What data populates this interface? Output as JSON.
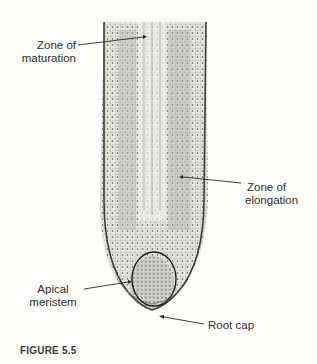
{
  "figure": {
    "caption": "FIGURE 5.5",
    "labels": {
      "maturation_line1": "Zone of",
      "maturation_line2": "maturation",
      "elongation_line1": "Zone of",
      "elongation_line2": "elongation",
      "meristem_line1": "Apical",
      "meristem_line2": "meristem",
      "root_cap": "Root cap"
    }
  }
}
